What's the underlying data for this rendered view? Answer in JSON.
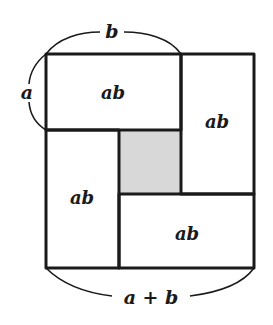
{
  "diagram": {
    "colors": {
      "stroke": "#1a1a1a",
      "shade": "#d8d8d8",
      "background": "#ffffff"
    },
    "labels": {
      "top_brace": "b",
      "left_brace": "a",
      "bottom_brace": "a + b",
      "rect_top_left": "ab",
      "rect_right": "ab",
      "rect_bottom_left": "ab",
      "rect_bottom_right": "ab"
    },
    "regions": [
      {
        "name": "rect-top-left",
        "label": "ab",
        "shaded": false
      },
      {
        "name": "rect-right",
        "label": "ab",
        "shaded": false
      },
      {
        "name": "rect-bottom-left",
        "label": "ab",
        "shaded": false
      },
      {
        "name": "rect-bottom-right",
        "label": "ab",
        "shaded": false
      },
      {
        "name": "center-square",
        "label": "",
        "shaded": true
      }
    ]
  }
}
